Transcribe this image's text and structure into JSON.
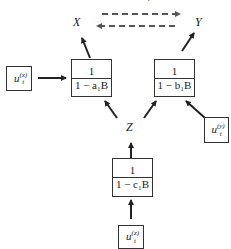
{
  "diagram": {
    "top_mark": "?",
    "nodes": {
      "X": {
        "label": "X"
      },
      "Y": {
        "label": "Y"
      },
      "Z": {
        "label": "Z"
      }
    },
    "filters": {
      "a": {
        "numerator": "1",
        "denominator": "1 − a₁B"
      },
      "b": {
        "numerator": "1",
        "denominator": "1 − b₁B"
      },
      "c": {
        "numerator": "1",
        "denominator": "1 − c₁B"
      }
    },
    "inputs": {
      "x": {
        "base": "u",
        "sub": "t",
        "sup": "(x)"
      },
      "y": {
        "base": "u",
        "sub": "t",
        "sup": "(y)"
      },
      "z": {
        "base": "u",
        "sub": "t",
        "sup": "(z)"
      }
    },
    "edges": [
      {
        "from": "u_t^(x)",
        "to": "filter_a",
        "style": "solid"
      },
      {
        "from": "filter_a",
        "to": "X",
        "style": "solid"
      },
      {
        "from": "u_t^(y)",
        "to": "filter_b",
        "style": "solid"
      },
      {
        "from": "filter_b",
        "to": "Y",
        "style": "solid"
      },
      {
        "from": "u_t^(z)",
        "to": "filter_c",
        "style": "solid"
      },
      {
        "from": "filter_c",
        "to": "Z",
        "style": "solid"
      },
      {
        "from": "Z",
        "to": "filter_a",
        "style": "solid"
      },
      {
        "from": "Z",
        "to": "filter_b",
        "style": "solid"
      },
      {
        "from": "X",
        "to": "Y",
        "style": "dashed"
      },
      {
        "from": "Y",
        "to": "X",
        "style": "dashed"
      }
    ],
    "colors": {
      "line": "#333333",
      "dashed": "#555555"
    }
  }
}
